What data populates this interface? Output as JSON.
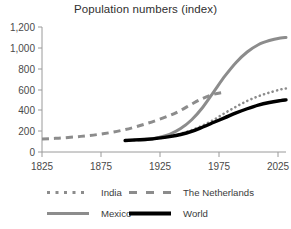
{
  "chart_data": {
    "type": "line",
    "title": "Population numbers (index)",
    "xlabel": "",
    "ylabel": "",
    "xlim": [
      1825,
      2045
    ],
    "ylim": [
      0,
      1200
    ],
    "xticks": [
      1825,
      1875,
      1925,
      1975,
      2025
    ],
    "xtick_labels": [
      "1825",
      "1875",
      "1925",
      "1975",
      "2025"
    ],
    "yticks": [
      0,
      200,
      400,
      600,
      800,
      1000,
      1200
    ],
    "ytick_labels": [
      "0",
      "200",
      "400",
      "600",
      "800",
      "1,000",
      "1,200"
    ],
    "grid": false,
    "legend_position": "bottom",
    "series": [
      {
        "name": "India",
        "style": "dotted",
        "color": "#8c8c8c",
        "x": [
          1900,
          1910,
          1920,
          1930,
          1940,
          1950,
          1960,
          1970,
          1980,
          1990,
          2000,
          2010,
          2020,
          2030,
          2040,
          2045
        ],
        "values": [
          110,
          115,
          120,
          132,
          150,
          175,
          210,
          255,
          310,
          375,
          435,
          490,
          535,
          570,
          600,
          610
        ]
      },
      {
        "name": "The Netherlands",
        "style": "dashed",
        "color": "#8c8c8c",
        "x": [
          1825,
          1840,
          1860,
          1880,
          1900,
          1920,
          1940,
          1950,
          1960,
          1970,
          1980,
          1990
        ],
        "values": [
          125,
          133,
          150,
          175,
          215,
          275,
          350,
          400,
          460,
          515,
          555,
          575
        ]
      },
      {
        "name": "Mexico",
        "style": "solid",
        "color": "#8c8c8c",
        "x": [
          1900,
          1910,
          1920,
          1930,
          1940,
          1950,
          1960,
          1970,
          1980,
          1990,
          2000,
          2010,
          2020,
          2030,
          2040,
          2045
        ],
        "values": [
          110,
          118,
          120,
          140,
          170,
          225,
          310,
          430,
          580,
          730,
          860,
          960,
          1030,
          1070,
          1095,
          1100
        ]
      },
      {
        "name": "World",
        "style": "solid-bold",
        "color": "#000000",
        "x": [
          1900,
          1910,
          1920,
          1930,
          1940,
          1950,
          1960,
          1970,
          1980,
          1990,
          2000,
          2010,
          2020,
          2030,
          2040,
          2045
        ],
        "values": [
          110,
          116,
          122,
          133,
          148,
          168,
          198,
          240,
          285,
          330,
          375,
          415,
          450,
          475,
          493,
          500
        ]
      }
    ]
  },
  "legend": {
    "items": [
      {
        "label": "India",
        "marker": "dotted-line-swatch"
      },
      {
        "label": "The Netherlands",
        "marker": "dashed-line-swatch"
      },
      {
        "label": "Mexico",
        "marker": "solid-gray-line-swatch"
      },
      {
        "label": "World",
        "marker": "solid-black-line-swatch"
      }
    ]
  }
}
